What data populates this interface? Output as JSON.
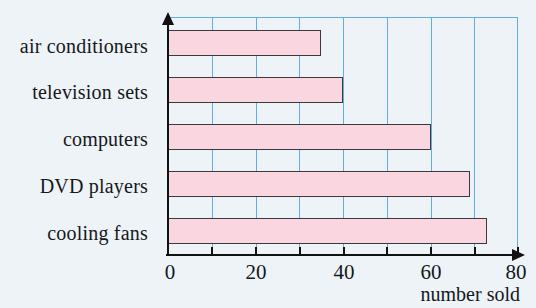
{
  "chart_data": {
    "type": "bar",
    "orientation": "horizontal",
    "title": "",
    "xlabel": "number sold",
    "ylabel": "",
    "categories": [
      "air conditioners",
      "television sets",
      "computers",
      "DVD players",
      "cooling fans"
    ],
    "values": [
      35,
      40,
      60,
      69,
      73
    ],
    "xlim": [
      0,
      80
    ],
    "xticks": [
      0,
      20,
      40,
      60,
      80
    ],
    "xtick_labels": [
      "0",
      "20",
      "40",
      "60",
      "80"
    ],
    "gridlines_every": 10,
    "grid": true,
    "legend": "none",
    "colors": {
      "bar_fill": "#fad7e0",
      "bar_border": "#3a3a3a",
      "gridline": "#63aedd",
      "axis": "#111111",
      "background": "#eef3f7",
      "text": "#15181c"
    }
  }
}
